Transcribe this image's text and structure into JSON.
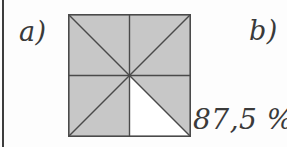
{
  "page": {
    "background_color": "#fdfdfd",
    "rule_color": "#3d3d3d",
    "ink_color": "#3a3a3a"
  },
  "labels": {
    "part_a": "a)",
    "part_b": "b)"
  },
  "answer": {
    "percent_text": "87,5 %"
  },
  "figure": {
    "name": "square-divided-into-eighths",
    "shape": "square",
    "total_parts": 8,
    "shaded_parts": 7,
    "unshaded_parts": 1,
    "shaded_fraction": "7/8",
    "shaded_percent": "87,5 %",
    "fill_color": "#c7c7c7",
    "empty_color": "#ffffff",
    "stroke_color": "#4a4a4a",
    "divider_lines": [
      "vertical-midline",
      "horizontal-midline",
      "diagonal-top-left-to-bottom-right",
      "diagonal-top-right-to-bottom-left"
    ],
    "segments": [
      {
        "id": "top-left-upper",
        "shaded": true
      },
      {
        "id": "top-left-lower",
        "shaded": true
      },
      {
        "id": "top-right-upper",
        "shaded": true
      },
      {
        "id": "top-right-lower",
        "shaded": true
      },
      {
        "id": "bottom-left-upper",
        "shaded": true
      },
      {
        "id": "bottom-left-lower",
        "shaded": true
      },
      {
        "id": "bottom-right-upper",
        "shaded": true
      },
      {
        "id": "bottom-right-lower",
        "shaded": false
      }
    ]
  }
}
